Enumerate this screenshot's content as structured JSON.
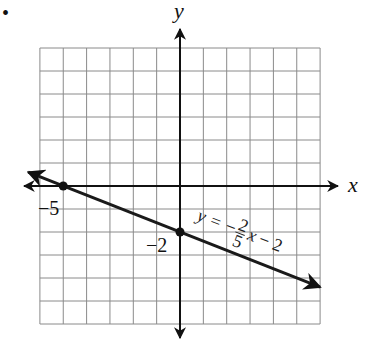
{
  "problem_marker": "•",
  "chart_data": {
    "type": "line",
    "title": "",
    "xlabel": "x",
    "ylabel": "y",
    "xlim": [
      -6,
      6
    ],
    "ylim": [
      -6,
      6
    ],
    "grid": true,
    "series": [
      {
        "name": "y = -2/5 x - 2",
        "equation": "y = -(2/5)x - 2",
        "slope": -0.4,
        "intercept": -2,
        "x": [
          -6.5,
          6
        ],
        "y": [
          0.6,
          -4.4
        ]
      }
    ],
    "points": [
      {
        "x": -5,
        "y": 0,
        "label": "−5"
      },
      {
        "x": 0,
        "y": -2,
        "label": "−2"
      }
    ],
    "annotations": {
      "equation_label": {
        "y": "y",
        "eq": "=",
        "minus": "−",
        "num": "2",
        "den": "5",
        "x": "x",
        "tail": "− 2"
      }
    }
  }
}
